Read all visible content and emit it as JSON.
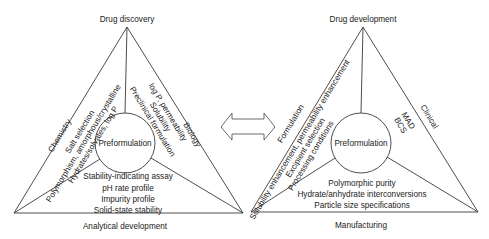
{
  "left_diagram": {
    "top_label": "Drug discovery",
    "bottom_label": "Analytical development",
    "center_label": "Preformulation",
    "left_side": {
      "label": "Chemistry",
      "items": [
        "Salt selection",
        "Polymorphism, amorphous/crystalline",
        "Hydrates/solvates, log P"
      ]
    },
    "right_side": {
      "label": "Biology",
      "items": [
        "log P, permeability",
        "Solubility",
        "Preclinical formulation"
      ]
    },
    "bottom_items": [
      "Stability-indicating assay",
      "pH rate profile",
      "Impurity profile",
      "Solid-state stability"
    ]
  },
  "connector": {
    "icon": "double-arrow-icon"
  },
  "right_diagram": {
    "top_label": "Drug development",
    "bottom_label": "Manufacturing",
    "center_label": "Preformulation",
    "left_side": {
      "label": "Formulation",
      "items": [
        "Solubility enhancement, permeability enhancement",
        "Excipient selection",
        "Processing conditions"
      ]
    },
    "right_side": {
      "label": "Clinical",
      "items": [
        "MAD",
        "BCS"
      ]
    },
    "bottom_items": [
      "Polymorphic purity",
      "Hydrate/anhydrate interconversions",
      "Particle size specifications"
    ]
  }
}
